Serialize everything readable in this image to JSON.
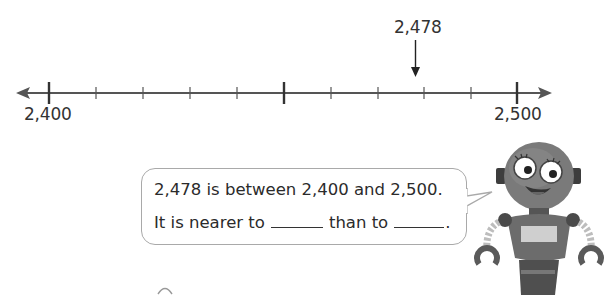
{
  "number_line": {
    "start_label": "2,400",
    "end_label": "2,500",
    "start_value": 2400,
    "end_value": 2500,
    "tick_interval": 10,
    "midpoint_value": 2450,
    "marker_label": "2,478",
    "marker_value": 2478,
    "line_color": "#555555"
  },
  "speech_bubble": {
    "line1": "2,478 is between 2,400 and 2,500.",
    "line2_part1": "It is nearer to",
    "line2_part2": "than to",
    "line2_end": "."
  },
  "robot": {
    "icon": "robot-mascot-icon"
  }
}
